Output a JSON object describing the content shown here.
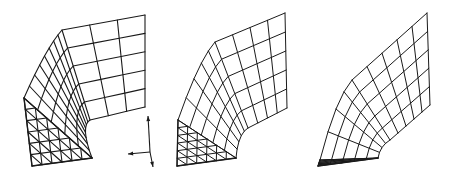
{
  "figure": {
    "width": 452,
    "height": 177,
    "background": "#ffffff",
    "stroke_color": "#1a1a1a"
  },
  "meshes": [
    {
      "id": "mesh-1",
      "description": "Curved wall mesh with triangular front face, refined grid near bend",
      "outer_top_right": [
        145,
        15
      ],
      "outer_bend": [
        62,
        30
      ],
      "outer_bottom": [
        24,
        98
      ],
      "inner_top_right": [
        145,
        107
      ],
      "inner_bend": [
        90,
        120
      ],
      "inner_bottom": [
        92,
        158
      ],
      "front_bottom_left": [
        32,
        166
      ],
      "rows": 5,
      "cols_flat": 3,
      "cols_bend": 8,
      "tri_rows": 6,
      "stroke_width": 1.1
    },
    {
      "id": "mesh-2",
      "description": "Curved wall mesh, uniform grid",
      "outer_top_right": [
        285,
        13
      ],
      "outer_bend": [
        215,
        42
      ],
      "outer_bottom": [
        178,
        120
      ],
      "inner_top_right": [
        287,
        108
      ],
      "inner_bend": [
        248,
        128
      ],
      "inner_bottom": [
        236,
        158
      ],
      "front_bottom_left": [
        177,
        166
      ],
      "rows": 5,
      "cols_flat": 4,
      "cols_bend": 5,
      "tri_rows": 6,
      "stroke_width": 1.0
    },
    {
      "id": "mesh-3",
      "description": "Curved wall mesh, thin sweep",
      "outer_top_right": [
        427,
        13
      ],
      "outer_bend": [
        352,
        80
      ],
      "outer_bottom": [
        320,
        160
      ],
      "inner_top_right": [
        430,
        105
      ],
      "inner_bend": [
        390,
        140
      ],
      "inner_bottom": [
        378,
        158
      ],
      "front_bottom_left": [
        318,
        166
      ],
      "rows": 5,
      "cols_flat": 5,
      "cols_bend": 4,
      "tri_rows": 5,
      "stroke_width": 1.0
    }
  ],
  "axes_glyph": {
    "origin": [
      150,
      152
    ],
    "up": [
      148,
      116
    ],
    "left": [
      128,
      154
    ],
    "down": [
      153,
      167
    ]
  }
}
